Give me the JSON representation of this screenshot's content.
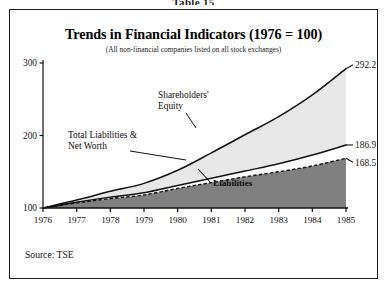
{
  "table_caption": "Table 15",
  "figure": {
    "title": "Trends in Financial Indicators (1976 = 100)",
    "subtitle": "(All non-financial companies listed on all stock exchanges)",
    "source": "Source: TSE"
  },
  "annotations": {
    "shareholders_equity": "Shareholders'",
    "shareholders_equity_line2": "Equity",
    "total_liabilities": "Total Liabilities &",
    "total_liabilities_line2": "Net Worth",
    "liabilities": "Liabilities"
  },
  "endpoint_labels": {
    "total": "292.2",
    "equity": "186.9",
    "liabilities": "168.5"
  },
  "colors": {
    "equity_fill": "#e8e8e8",
    "liabilities_fill": "#808080",
    "line": "#111111",
    "frame": "#1c1c1c",
    "background": "#ffffff"
  },
  "chart_data": {
    "type": "area",
    "title": "Trends in Financial Indicators (1976 = 100)",
    "subtitle": "(All non-financial companies listed on all stock exchanges)",
    "xlabel": "",
    "ylabel": "",
    "xlim": [
      1976,
      1985
    ],
    "ylim": [
      100,
      300
    ],
    "yticks": [
      100,
      200,
      300
    ],
    "ytick_labels": [
      "100",
      "200",
      "300"
    ],
    "xticks": [
      1976,
      1977,
      1978,
      1979,
      1980,
      1981,
      1982,
      1983,
      1984,
      1985
    ],
    "xtick_labels": [
      "1976",
      "1977",
      "1978",
      "1979",
      "1980",
      "1981",
      "1982",
      "1983",
      "1984",
      "1985"
    ],
    "grid": false,
    "legend": "annotations-inline",
    "x": [
      1976,
      1977,
      1978,
      1979,
      1980,
      1981,
      1982,
      1983,
      1984,
      1985
    ],
    "series": [
      {
        "name": "Total Liabilities & Net Worth",
        "style": "solid-line-upper-fill",
        "end_label": "292.2",
        "values": [
          100.0,
          111.0,
          123.0,
          134.0,
          152.0,
          176.0,
          201.0,
          226.0,
          256.0,
          292.2
        ]
      },
      {
        "name": "Shareholders' Equity",
        "style": "solid-line-lower-bound",
        "end_label": "186.9",
        "values": [
          100.0,
          108.0,
          115.0,
          121.0,
          131.0,
          141.0,
          151.0,
          161.0,
          173.0,
          186.9
        ]
      },
      {
        "name": "Liabilities",
        "style": "dashed-line",
        "end_label": "168.5",
        "values": [
          100.0,
          107.0,
          113.0,
          118.0,
          127.0,
          135.0,
          143.0,
          150.0,
          158.0,
          168.5
        ]
      }
    ]
  }
}
